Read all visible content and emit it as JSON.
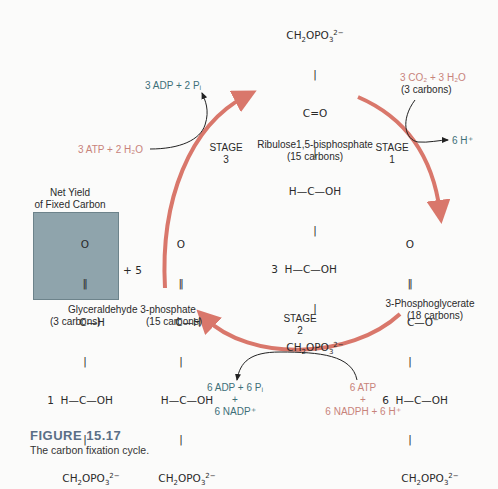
{
  "colors": {
    "cycle_arrow": "#d9776b",
    "teal_text": "#3d6f78",
    "pink_text": "#c8837a",
    "yield_box": "#8fa4ac",
    "figure_title": "#5a6f86"
  },
  "stages": [
    {
      "label": "STAGE",
      "number": "3"
    },
    {
      "label": "STAGE",
      "number": "1"
    },
    {
      "label": "STAGE",
      "number": "2"
    }
  ],
  "molecules": {
    "rubp": {
      "lines": [
        "CH₂OPO₃²⁻",
        "|",
        "C=O",
        "|",
        "H—C—OH",
        "|",
        "3  H—C—OH",
        "|",
        "CH₂OPO₃²⁻"
      ],
      "name": "Ribulose1,5-bisphosphate",
      "carbons": "(15 carbons)"
    },
    "pga": {
      "lines": [
        "O",
        "‖",
        "C—O⁻",
        "|",
        "6  H—C—OH",
        "|",
        "CH₂OPO₃²⁻"
      ],
      "name": "3-Phosphoglycerate",
      "carbons": "(18 carbons)"
    },
    "g3p_yield": {
      "header_line1": "Net Yield",
      "header_line2": "of Fixed Carbon",
      "lines": [
        "O",
        "‖",
        "C—H",
        "|",
        "1  H—C—OH",
        "|",
        "CH₂OPO₃²⁻"
      ],
      "carbons": "(3 carbons)"
    },
    "g3p_recycled": {
      "prefix": "+ 5",
      "lines": [
        "O",
        "‖",
        "C—H",
        "|",
        "H—C—OH",
        "|",
        "CH₂OPO₃²⁻"
      ],
      "carbons": "(15 carbons)"
    },
    "g3p_name": "Glyceraldehyde 3-phosphate"
  },
  "reactants": {
    "stage1_in": "3 CO₂ + 3 H₂O",
    "stage1_in_carbons": "(3 carbons)",
    "stage1_out": "6 H⁺",
    "stage3_in": "3 ATP + 2 H₂O",
    "stage3_out": "3 ADP + 2 Pᵢ",
    "stage2_out_line1": "6 ADP + 6 Pᵢ",
    "stage2_out_plus": "+",
    "stage2_out_line2": "6 NADP⁺",
    "stage2_in_line1": "6 ATP",
    "stage2_in_plus": "+",
    "stage2_in_line2": "6 NADPH + 6 H⁺"
  },
  "figure": {
    "title": "FIGURE 15.17",
    "caption": "The carbon fixation cycle."
  }
}
